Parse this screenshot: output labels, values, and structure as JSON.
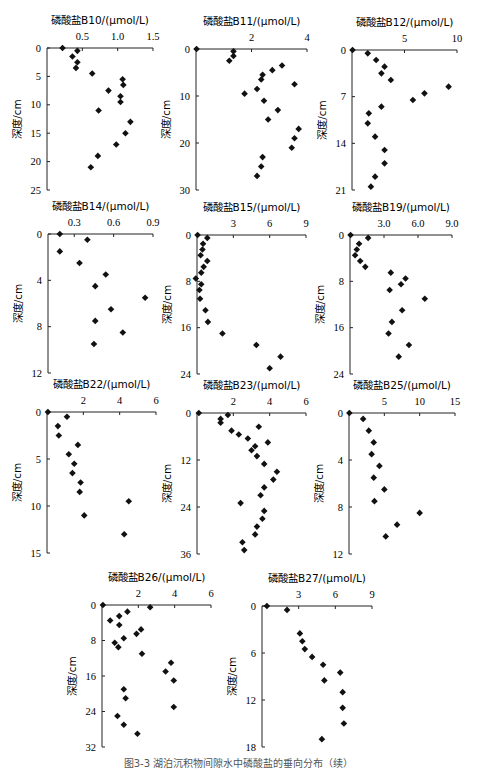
{
  "figure": {
    "caption": "图3-3  湖泊沉积物间隙水中磷酸盐的垂向分布（续）"
  },
  "chart_data": [
    {
      "type": "scatter",
      "panel": "B10",
      "title": "磷酸盐B10/(μmol/L)",
      "ylabel": "深度/cm",
      "xlim": [
        0,
        1.5
      ],
      "xticks": [
        "0.5",
        "1.0",
        "1.5"
      ],
      "xtick_values": [
        0.5,
        1.0,
        1.5
      ],
      "ylim": [
        0,
        25
      ],
      "yticks": [
        0,
        5,
        10,
        15,
        20,
        25
      ],
      "points": [
        [
          0.22,
          0
        ],
        [
          0.43,
          0.5
        ],
        [
          0.36,
          1.5
        ],
        [
          0.43,
          2.5
        ],
        [
          0.41,
          3.5
        ],
        [
          0.64,
          4.5
        ],
        [
          1.07,
          5.5
        ],
        [
          1.08,
          6.5
        ],
        [
          0.87,
          7.5
        ],
        [
          1.04,
          8.5
        ],
        [
          1.04,
          9.5
        ],
        [
          0.73,
          11
        ],
        [
          1.18,
          13
        ],
        [
          1.11,
          15
        ],
        [
          0.98,
          17
        ],
        [
          0.72,
          19
        ],
        [
          0.62,
          21
        ]
      ]
    },
    {
      "type": "scatter",
      "panel": "B11",
      "title": "磷酸盐B11/(μmol/L)",
      "ylabel": "深度/cm",
      "xlim": [
        0,
        4
      ],
      "xticks": [
        "2",
        "4"
      ],
      "xtick_values": [
        2,
        4
      ],
      "ylim": [
        0,
        30
      ],
      "yticks": [
        0,
        10,
        20,
        30
      ],
      "points": [
        [
          0.02,
          0
        ],
        [
          1.35,
          0.5
        ],
        [
          1.35,
          1.5
        ],
        [
          1.2,
          2.5
        ],
        [
          3.1,
          3.5
        ],
        [
          2.75,
          4.5
        ],
        [
          2.4,
          5.5
        ],
        [
          2.35,
          6.5
        ],
        [
          3.55,
          7.5
        ],
        [
          2.2,
          8.5
        ],
        [
          1.75,
          9.5
        ],
        [
          2.45,
          11
        ],
        [
          2.95,
          13
        ],
        [
          2.6,
          15
        ],
        [
          3.7,
          17
        ],
        [
          3.55,
          19
        ],
        [
          3.45,
          21
        ],
        [
          2.4,
          23
        ],
        [
          2.35,
          25
        ],
        [
          2.2,
          27
        ]
      ]
    },
    {
      "type": "scatter",
      "panel": "B12",
      "title": "磷酸盐B12/(μmol/L)",
      "ylabel": "深度/cm",
      "xlim": [
        0,
        10
      ],
      "xticks": [
        "5",
        "10"
      ],
      "xtick_values": [
        5,
        10
      ],
      "ylim": [
        0,
        21
      ],
      "yticks": [
        0,
        7,
        14,
        21
      ],
      "points": [
        [
          0.05,
          0
        ],
        [
          1.5,
          0.5
        ],
        [
          2.3,
          1.5
        ],
        [
          3.1,
          2.5
        ],
        [
          2.8,
          3.5
        ],
        [
          3.7,
          4.5
        ],
        [
          9.2,
          5.5
        ],
        [
          6.9,
          6.5
        ],
        [
          5.8,
          7.5
        ],
        [
          2.8,
          8.5
        ],
        [
          1.6,
          9.5
        ],
        [
          1.5,
          11
        ],
        [
          2.2,
          13
        ],
        [
          3.1,
          15
        ],
        [
          3.1,
          17
        ],
        [
          2.2,
          19
        ],
        [
          1.8,
          20.5
        ]
      ]
    },
    {
      "type": "scatter",
      "panel": "B14",
      "title": "磷酸盐B14/(μmol/L)",
      "ylabel": "深度/cm",
      "xlim": [
        0.1,
        0.9
      ],
      "xticks": [
        "0.3",
        "0.6",
        "0.9"
      ],
      "xtick_values": [
        0.3,
        0.6,
        0.9
      ],
      "ylim": [
        0,
        12
      ],
      "yticks": [
        0,
        4,
        8,
        12
      ],
      "points": [
        [
          0.19,
          0
        ],
        [
          0.4,
          0.5
        ],
        [
          0.19,
          1.5
        ],
        [
          0.34,
          2.5
        ],
        [
          0.54,
          3.5
        ],
        [
          0.46,
          4.5
        ],
        [
          0.84,
          5.5
        ],
        [
          0.58,
          6.5
        ],
        [
          0.46,
          7.5
        ],
        [
          0.67,
          8.5
        ],
        [
          0.45,
          9.5
        ]
      ]
    },
    {
      "type": "scatter",
      "panel": "B15",
      "title": "磷酸盐B15/(μmol/L)",
      "ylabel": "深度/cm",
      "xlim": [
        0,
        9
      ],
      "xticks": [
        "3",
        "6",
        "9"
      ],
      "xtick_values": [
        3,
        6,
        9
      ],
      "ylim": [
        0,
        24
      ],
      "yticks": [
        0,
        8,
        16,
        24
      ],
      "points": [
        [
          0.05,
          0
        ],
        [
          0.85,
          0.5
        ],
        [
          0.5,
          1.5
        ],
        [
          0.45,
          2.5
        ],
        [
          0.3,
          3.5
        ],
        [
          0.85,
          4.5
        ],
        [
          0.55,
          5.5
        ],
        [
          0.35,
          6.5
        ],
        [
          -0.1,
          7.5
        ],
        [
          0.35,
          8.5
        ],
        [
          0.2,
          9.5
        ],
        [
          0.25,
          11
        ],
        [
          0.7,
          13
        ],
        [
          0.9,
          15
        ],
        [
          2.1,
          17
        ],
        [
          4.9,
          19
        ],
        [
          6.9,
          21
        ],
        [
          6.0,
          23
        ]
      ]
    },
    {
      "type": "scatter",
      "panel": "B19",
      "title": "磷酸盐B19/(μmol/L)",
      "ylabel": "深度/cm",
      "xlim": [
        0,
        9
      ],
      "xticks": [
        "3.0",
        "6.0",
        "9.0"
      ],
      "xtick_values": [
        3,
        6,
        9
      ],
      "ylim": [
        0,
        24
      ],
      "yticks": [
        0,
        8,
        16,
        24
      ],
      "points": [
        [
          0.05,
          0
        ],
        [
          1.6,
          0.5
        ],
        [
          0.8,
          1.5
        ],
        [
          0.6,
          2.5
        ],
        [
          0.45,
          3.5
        ],
        [
          0.9,
          4.5
        ],
        [
          1.35,
          5.5
        ],
        [
          3.6,
          6.5
        ],
        [
          4.9,
          7.5
        ],
        [
          4.5,
          8.5
        ],
        [
          3.5,
          9.5
        ],
        [
          6.6,
          11
        ],
        [
          4.6,
          13
        ],
        [
          3.7,
          15
        ],
        [
          3.4,
          17
        ],
        [
          5.2,
          19
        ],
        [
          4.3,
          21
        ]
      ]
    },
    {
      "type": "scatter",
      "panel": "B22",
      "title": "磷酸盐B22/(μmol/L)",
      "ylabel": "深度/cm",
      "xlim": [
        0,
        6
      ],
      "xticks": [
        "2",
        "4",
        "6"
      ],
      "xtick_values": [
        2,
        4,
        6
      ],
      "ylim": [
        0,
        15
      ],
      "yticks": [
        0,
        5,
        10,
        15
      ],
      "points": [
        [
          0.05,
          0
        ],
        [
          1.1,
          0.5
        ],
        [
          0.6,
          1.5
        ],
        [
          0.65,
          2.5
        ],
        [
          1.7,
          3.5
        ],
        [
          1.2,
          4.5
        ],
        [
          1.5,
          5.5
        ],
        [
          1.4,
          6.5
        ],
        [
          1.85,
          7.5
        ],
        [
          1.8,
          8.5
        ],
        [
          4.5,
          9.5
        ],
        [
          2.05,
          11
        ],
        [
          4.25,
          13
        ]
      ]
    },
    {
      "type": "scatter",
      "panel": "B23",
      "title": "磷酸盐B23/(μmol/L)",
      "ylabel": "深度/cm",
      "xlim": [
        0,
        6
      ],
      "xticks": [
        "2",
        "4",
        "6"
      ],
      "xtick_values": [
        2,
        4,
        6
      ],
      "ylim": [
        0,
        36
      ],
      "yticks": [
        0,
        12,
        24,
        36
      ],
      "points": [
        [
          0.1,
          0
        ],
        [
          1.7,
          0.5
        ],
        [
          1.3,
          1.5
        ],
        [
          1.3,
          2.5
        ],
        [
          3.4,
          3.5
        ],
        [
          1.9,
          4.5
        ],
        [
          2.3,
          5.5
        ],
        [
          2.8,
          6.5
        ],
        [
          3.9,
          7.5
        ],
        [
          3.2,
          8.5
        ],
        [
          3.0,
          9.5
        ],
        [
          3.3,
          11
        ],
        [
          3.7,
          13
        ],
        [
          4.4,
          15
        ],
        [
          4.2,
          17
        ],
        [
          3.7,
          19
        ],
        [
          3.5,
          21
        ],
        [
          2.4,
          23
        ],
        [
          3.7,
          25
        ],
        [
          3.6,
          27
        ],
        [
          3.3,
          29
        ],
        [
          3.2,
          31
        ],
        [
          2.5,
          33
        ],
        [
          2.6,
          35
        ]
      ]
    },
    {
      "type": "scatter",
      "panel": "B25",
      "title": "磷酸盐B25/(μmol/L)",
      "ylabel": "深度/cm",
      "xlim": [
        0,
        15
      ],
      "xticks": [
        "5",
        "10",
        "15"
      ],
      "xtick_values": [
        5,
        10,
        15
      ],
      "ylim": [
        0,
        12
      ],
      "yticks": [
        0,
        4,
        8,
        12
      ],
      "points": [
        [
          0.05,
          0
        ],
        [
          2.0,
          0.5
        ],
        [
          2.8,
          1.5
        ],
        [
          3.5,
          2.5
        ],
        [
          3.2,
          3.5
        ],
        [
          4.3,
          4.5
        ],
        [
          3.5,
          5.5
        ],
        [
          5.0,
          6.5
        ],
        [
          3.6,
          7.5
        ],
        [
          10.0,
          8.5
        ],
        [
          6.8,
          9.5
        ],
        [
          5.2,
          10.5
        ]
      ]
    },
    {
      "type": "scatter",
      "panel": "B26",
      "title": "磷酸盐B26/(μmol/L)",
      "ylabel": "深度/cm",
      "xlim": [
        0,
        6
      ],
      "xticks": [
        "2",
        "4",
        "6"
      ],
      "xtick_values": [
        2,
        4,
        6
      ],
      "ylim": [
        0,
        32
      ],
      "yticks": [
        0,
        8,
        16,
        24,
        32
      ],
      "points": [
        [
          0.05,
          0
        ],
        [
          2.65,
          0.5
        ],
        [
          1.4,
          1.5
        ],
        [
          0.95,
          2.5
        ],
        [
          0.45,
          3.5
        ],
        [
          0.95,
          4.5
        ],
        [
          2.15,
          5.5
        ],
        [
          1.9,
          6.5
        ],
        [
          1.2,
          7.5
        ],
        [
          0.7,
          8.5
        ],
        [
          0.9,
          9.5
        ],
        [
          2.2,
          11
        ],
        [
          3.8,
          13
        ],
        [
          3.5,
          15
        ],
        [
          3.95,
          17
        ],
        [
          1.2,
          19
        ],
        [
          1.3,
          21
        ],
        [
          3.95,
          23
        ],
        [
          0.85,
          25
        ],
        [
          1.2,
          27
        ],
        [
          1.95,
          29
        ]
      ]
    },
    {
      "type": "scatter",
      "panel": "B27",
      "title": "磷酸盐B27/(μmol/L)",
      "ylabel": "深度/cm",
      "xlim": [
        0,
        9
      ],
      "xticks": [
        "3",
        "6",
        "9"
      ],
      "xtick_values": [
        3,
        6,
        9
      ],
      "ylim": [
        0,
        18
      ],
      "yticks": [
        0,
        6,
        12,
        18
      ],
      "points": [
        [
          0.4,
          0
        ],
        [
          2.05,
          0.5
        ],
        [
          3.1,
          3.5
        ],
        [
          3.3,
          4.5
        ],
        [
          3.5,
          5.5
        ],
        [
          4.1,
          6.5
        ],
        [
          5.0,
          7.5
        ],
        [
          6.4,
          8.5
        ],
        [
          5.1,
          9.5
        ],
        [
          6.6,
          11
        ],
        [
          6.6,
          13
        ],
        [
          6.7,
          15
        ],
        [
          4.9,
          17
        ]
      ]
    }
  ]
}
